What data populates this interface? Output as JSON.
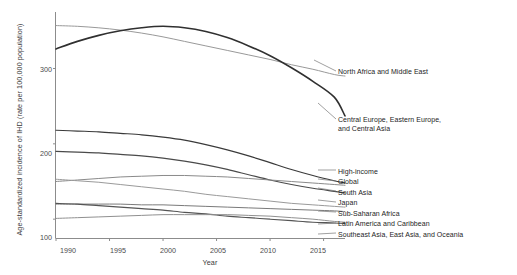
{
  "chart_data": {
    "type": "line",
    "title": "",
    "xlabel": "Year",
    "ylabel": "Age-standardized incidence of IHD (rate per 100,000 population)",
    "xlim": [
      1990,
      2017
    ],
    "ylim": [
      75,
      375
    ],
    "xticks": [
      1990,
      1995,
      2000,
      2005,
      2010,
      2015
    ],
    "yticks": [
      100,
      200,
      300
    ],
    "grid": false,
    "legend_position": "right-inline-labels",
    "x": [
      1990,
      1992,
      1994,
      1996,
      1998,
      2000,
      2002,
      2004,
      2006,
      2008,
      2010,
      2012,
      2014,
      2016,
      2017
    ],
    "series": [
      {
        "name": "North Africa and Middle East",
        "color": "#999999",
        "width": 1.0,
        "label_x": 338,
        "label_y": 72,
        "values": [
          357,
          356,
          354,
          351,
          347,
          342,
          336,
          330,
          324,
          318,
          312,
          305,
          299,
          292,
          290
        ]
      },
      {
        "name": "Central Europe, Eastern Europe, and Central Asia",
        "color": "#303030",
        "width": 1.6,
        "label_x": 338,
        "label_y": 120,
        "values": [
          326,
          336,
          344,
          350,
          354,
          356,
          354,
          349,
          341,
          330,
          317,
          301,
          283,
          262,
          237
        ]
      },
      {
        "name": "High-income",
        "color": "#3a3a3a",
        "width": 1.2,
        "label_x": 338,
        "label_y": 172,
        "values": [
          218,
          217,
          216,
          214,
          212,
          209,
          205,
          199,
          192,
          184,
          175,
          166,
          158,
          151,
          148
        ]
      },
      {
        "name": "Global",
        "color": "#4a4a4a",
        "width": 1.2,
        "label_x": 338,
        "label_y": 183,
        "values": [
          190,
          189,
          188,
          186,
          184,
          181,
          177,
          172,
          166,
          159,
          152,
          146,
          141,
          137,
          135
        ]
      },
      {
        "name": "South Asia",
        "color": "#8a8a8a",
        "width": 1.0,
        "label_x": 338,
        "label_y": 193,
        "values": [
          150,
          152,
          154,
          156,
          157,
          158,
          158,
          157,
          156,
          154,
          152,
          150,
          148,
          146,
          145
        ]
      },
      {
        "name": "Japan",
        "color": "#9a9a9a",
        "width": 1.0,
        "label_x": 338,
        "label_y": 204,
        "values": [
          153,
          151,
          149,
          146,
          143,
          140,
          137,
          133,
          130,
          127,
          124,
          121,
          119,
          117,
          116
        ]
      },
      {
        "name": "Sub-Saharan Africa",
        "color": "#7a7a7a",
        "width": 1.0,
        "label_x": 338,
        "label_y": 214,
        "values": [
          120,
          120,
          120,
          120,
          119,
          119,
          118,
          117,
          116,
          115,
          114,
          113,
          112,
          111,
          110
        ]
      },
      {
        "name": "Latin America and Caribbean",
        "color": "#555555",
        "width": 1.1,
        "label_x": 338,
        "label_y": 225,
        "values": [
          121,
          120,
          118,
          116,
          114,
          112,
          109,
          107,
          104,
          102,
          100,
          98,
          96,
          95,
          94
        ]
      },
      {
        "name": "Southeast Asia, East Asia, and Oceania",
        "color": "#909090",
        "width": 1.0,
        "label_x": 338,
        "label_y": 235,
        "values": [
          101,
          102,
          103,
          104,
          105,
          106,
          106,
          106,
          106,
          105,
          104,
          102,
          100,
          97,
          96
        ]
      }
    ],
    "leader_lines": [
      {
        "name": "North Africa and Middle East",
        "x1": 314,
        "y1": 60,
        "x2": 336,
        "y2": 71
      },
      {
        "name": "Central Europe, Eastern Europe, and Central Asia",
        "x1": 318,
        "y1": 103,
        "x2": 336,
        "y2": 119
      },
      {
        "name": "High-income",
        "x1": 318,
        "y1": 170,
        "x2": 336,
        "y2": 170
      },
      {
        "name": "Global",
        "x1": 318,
        "y1": 179,
        "x2": 336,
        "y2": 181
      },
      {
        "name": "South Asia",
        "x1": 318,
        "y1": 188,
        "x2": 336,
        "y2": 191
      },
      {
        "name": "Japan",
        "x1": 318,
        "y1": 200,
        "x2": 336,
        "y2": 202
      },
      {
        "name": "Sub-Saharan Africa",
        "x1": 318,
        "y1": 211,
        "x2": 336,
        "y2": 212
      },
      {
        "name": "Latin America and Caribbean",
        "x1": 318,
        "y1": 224,
        "x2": 336,
        "y2": 223
      },
      {
        "name": "Southeast Asia, East Asia, and Oceania",
        "x1": 318,
        "y1": 234,
        "x2": 336,
        "y2": 233
      }
    ]
  },
  "labels": {
    "north_africa_middle_east": "North Africa and Middle East",
    "central_europe_line1": "Central Europe, Eastern Europe,",
    "central_europe_line2": "and Central Asia",
    "high_income": "High-income",
    "global": "Global",
    "south_asia": "South Asia",
    "japan": "Japan",
    "sub_saharan_africa": "Sub-Saharan Africa",
    "latin_america_caribbean": "Latin America and Caribbean",
    "southeast_east_asia_oceania": "Southeast Asia, East Asia, and Oceania"
  },
  "axes": {
    "ylabel": "Age-standardized incidence of IHD (rate per 100,000 population)",
    "xlabel": "Year",
    "ytick_labels": [
      "300",
      "200",
      "100"
    ],
    "xtick_labels": [
      "1990",
      "1995",
      "2000",
      "2005",
      "2010",
      "2015"
    ]
  },
  "colors": {
    "axis": "#8c8c8c",
    "text": "#222222",
    "background": "#ffffff"
  }
}
